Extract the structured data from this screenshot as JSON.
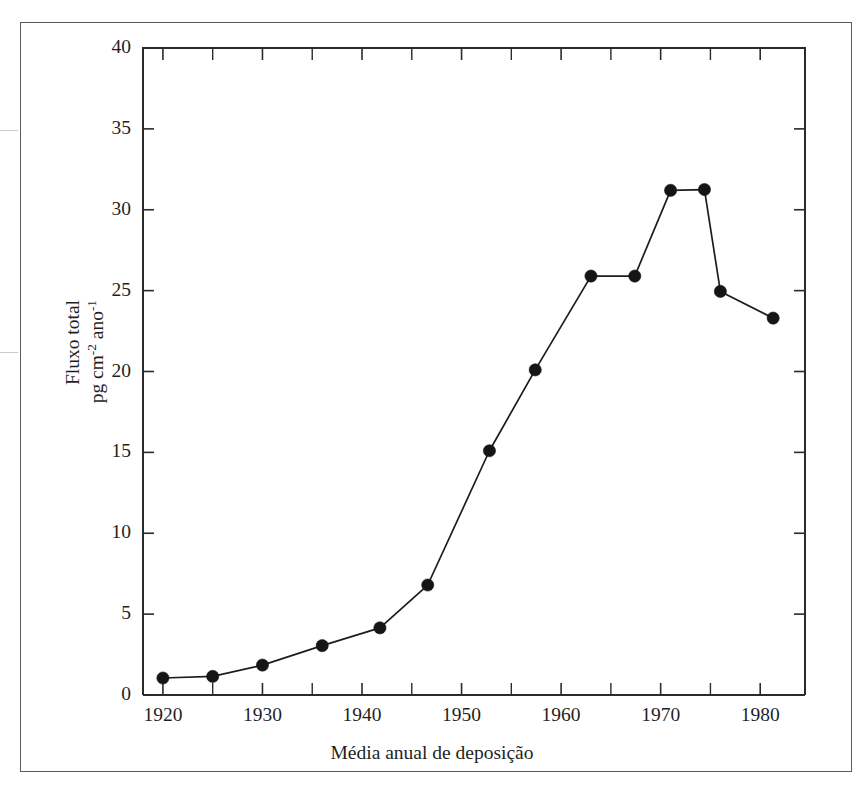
{
  "figure": {
    "border_color": "#5a5a5a",
    "background": "#ffffff"
  },
  "chart_data": {
    "type": "line",
    "title": "",
    "xlabel": "Média anual de deposição",
    "ylabel_line1": "Fluxo total",
    "ylabel_line2": "pg cm",
    "ylabel_line2_sup1": "-2",
    "ylabel_line2_mid": " ano",
    "ylabel_line2_sup2": "-1",
    "ylabel_full": "Fluxo total pg cm-2 ano-1",
    "xlim": [
      1918,
      1984.5
    ],
    "ylim": [
      0,
      40
    ],
    "xticks": [
      1920,
      1930,
      1940,
      1950,
      1960,
      1970,
      1980
    ],
    "xtick_labels": [
      "1920",
      "1930",
      "1940",
      "1950",
      "1960",
      "1970",
      "1980"
    ],
    "xticks_minor": [
      1925,
      1935,
      1945,
      1955,
      1965,
      1975
    ],
    "yticks": [
      0,
      5,
      10,
      15,
      20,
      25,
      30,
      35,
      40
    ],
    "ytick_labels": [
      "0",
      "5",
      "10",
      "15",
      "20",
      "25",
      "30",
      "35",
      "40"
    ],
    "grid": false,
    "legend": false,
    "marker": "filled-circle",
    "marker_color": "#151515",
    "line_color": "#1d1d1d",
    "series": [
      {
        "name": "Fluxo total",
        "x": [
          1920.0,
          1925.0,
          1930.0,
          1936.0,
          1941.8,
          1946.6,
          1952.8,
          1957.4,
          1963.0,
          1967.4,
          1971.0,
          1974.4,
          1976.0,
          1981.3
        ],
        "values": [
          1.05,
          1.15,
          1.85,
          3.05,
          4.15,
          6.8,
          15.1,
          20.1,
          25.9,
          25.9,
          31.2,
          31.25,
          24.95,
          23.3
        ]
      }
    ]
  }
}
